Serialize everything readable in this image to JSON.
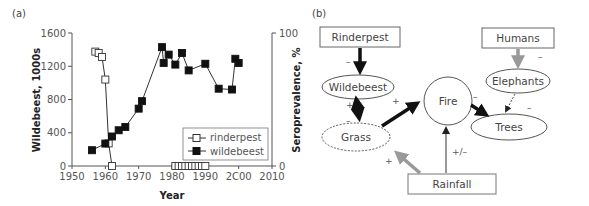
{
  "panels": {
    "a": {
      "label": "(a)"
    },
    "b": {
      "label": "(b)"
    }
  },
  "chart_data": [
    {
      "type": "line",
      "panel": "(a)",
      "xlabel": "Year",
      "ylabel": "Wildebeest, 1000s",
      "y2label": "Seroprevalence, %",
      "xlim": [
        1950,
        2010
      ],
      "ylim": [
        0,
        1600
      ],
      "y2lim": [
        0,
        100
      ],
      "xticks": [
        "1950",
        "1960",
        "1970",
        "1980",
        "1990",
        "2C00",
        "2010"
      ],
      "yticks": [
        "0",
        "400",
        "800",
        "1200",
        "1600"
      ],
      "y2ticks": [
        "0",
        "100"
      ],
      "grid": false,
      "legend_position": "lower right",
      "series": [
        {
          "name": "rinderpest",
          "marker": "open-square",
          "axis": "right",
          "x": [
            1957,
            1958,
            1959,
            1960,
            1961,
            1962,
            1981,
            1982,
            1983,
            1984,
            1985,
            1986,
            1987,
            1988,
            1989,
            1990
          ],
          "values": [
            86,
            85,
            82,
            65,
            17,
            0,
            0,
            0,
            0,
            0,
            0,
            0,
            0,
            0,
            0,
            0
          ]
        },
        {
          "name": "wildebeest",
          "marker": "filled-square",
          "axis": "left",
          "x": [
            1956,
            1960,
            1962,
            1964,
            1966,
            1970,
            1971,
            1977,
            1977.5,
            1979,
            1981,
            1983,
            1985,
            1990,
            1994,
            1998,
            1999,
            2000
          ],
          "values": [
            190,
            270,
            355,
            430,
            470,
            690,
            780,
            1430,
            1240,
            1340,
            1220,
            1360,
            1150,
            1230,
            930,
            920,
            1290,
            1240
          ]
        }
      ]
    }
  ],
  "diagram": {
    "nodes": {
      "rinderpest": "Rinderpest",
      "humans": "Humans",
      "wildebeest": "Wildebeest",
      "elephants": "Elephants",
      "fire": "Fire",
      "grass": "Grass",
      "trees": "Trees",
      "rainfall": "Rainfall"
    },
    "signs": {
      "rinderpest_wildebeest": "–",
      "humans_elephants": "–",
      "wildebeest_grass_top": "+",
      "wildebeest_grass_bottom": "–",
      "grass_fire": "+",
      "fire_trees": "–",
      "elephants_trees": "–",
      "rainfall_grass": "+",
      "rainfall_fire": "+/–"
    }
  }
}
